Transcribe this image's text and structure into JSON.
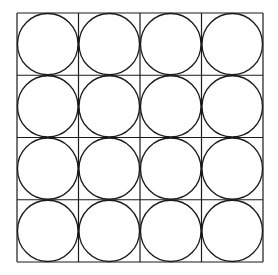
{
  "diagram": {
    "title": "",
    "rows": 4,
    "cols": 4,
    "grid": {
      "x": 17,
      "y": 13,
      "width": 246,
      "height": 249
    },
    "stroke_color": "#1a1a1a",
    "fill_color": "#ffffff",
    "shapes": "circle inscribed in each square cell"
  }
}
